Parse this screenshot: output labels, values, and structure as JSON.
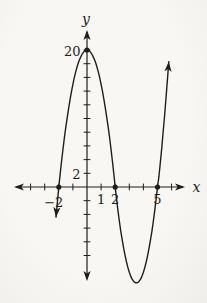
{
  "figure": {
    "background": "#f8f7f4",
    "ink": "#1f1e1c"
  },
  "chart_data": {
    "type": "line",
    "title": "",
    "xlabel": "x",
    "ylabel": "y",
    "grid": false,
    "legend": false,
    "x_range": [
      -5.2,
      6.9
    ],
    "y_range": [
      -13.8,
      22.9
    ],
    "x_ticks": [
      -4,
      -3,
      -2,
      -1,
      1,
      2,
      3,
      4,
      5,
      6
    ],
    "y_ticks": [
      -10,
      -8,
      -6,
      -4,
      -2,
      2,
      4,
      6,
      8,
      10,
      12,
      14,
      16,
      18,
      20
    ],
    "x_tick_labels": [
      {
        "value": -2,
        "label": "−2"
      },
      {
        "value": 1,
        "label": "1"
      },
      {
        "value": 2,
        "label": "2"
      },
      {
        "value": 5,
        "label": "5"
      }
    ],
    "y_tick_labels": [
      {
        "value": 2,
        "label": "2"
      },
      {
        "value": 20,
        "label": "20"
      }
    ],
    "x_intercepts": [
      -2,
      2,
      5
    ],
    "y_intercept": 20,
    "local_max_point": [
      0,
      20
    ],
    "local_min_point": [
      3.5,
      -14
    ],
    "marked_points": [
      [
        -2,
        0
      ],
      [
        0,
        20
      ],
      [
        2,
        0
      ],
      [
        5,
        0
      ]
    ],
    "open_ended_curve": true,
    "curve_points": [
      [
        -2.2,
        -4.4
      ],
      [
        -2.1,
        -2.2
      ],
      [
        -2,
        0
      ],
      [
        -1.9,
        1.95
      ],
      [
        -1.8,
        3.8
      ],
      [
        -1.7,
        5.55
      ],
      [
        -1.6,
        7.2
      ],
      [
        -1.5,
        8.75
      ],
      [
        -1.4,
        10.2
      ],
      [
        -1.3,
        11.55
      ],
      [
        -1.2,
        12.8
      ],
      [
        -1.1,
        13.95
      ],
      [
        -1,
        15
      ],
      [
        -0.9,
        15.95
      ],
      [
        -0.8,
        16.8
      ],
      [
        -0.7,
        17.55
      ],
      [
        -0.6,
        18.2
      ],
      [
        -0.5,
        18.75
      ],
      [
        -0.4,
        19.2
      ],
      [
        -0.3,
        19.55
      ],
      [
        -0.2,
        19.8
      ],
      [
        -0.1,
        19.95
      ],
      [
        0,
        20
      ],
      [
        0.1,
        19.95
      ],
      [
        0.2,
        19.8
      ],
      [
        0.3,
        19.55
      ],
      [
        0.4,
        19.2
      ],
      [
        0.5,
        18.75
      ],
      [
        0.6,
        18.2
      ],
      [
        0.7,
        17.55
      ],
      [
        0.8,
        16.8
      ],
      [
        0.9,
        15.95
      ],
      [
        1,
        15
      ],
      [
        1.1,
        13.95
      ],
      [
        1.2,
        12.8
      ],
      [
        1.3,
        11.55
      ],
      [
        1.4,
        10.2
      ],
      [
        1.5,
        8.75
      ],
      [
        1.6,
        7.2
      ],
      [
        1.7,
        5.55
      ],
      [
        1.8,
        3.8
      ],
      [
        1.9,
        1.95
      ],
      [
        2,
        0
      ],
      [
        2.1,
        -1.8
      ],
      [
        2.2,
        -3.48
      ],
      [
        2.3,
        -5.04
      ],
      [
        2.4,
        -6.47
      ],
      [
        2.5,
        -7.78
      ],
      [
        2.6,
        -8.96
      ],
      [
        2.7,
        -10.02
      ],
      [
        2.8,
        -10.95
      ],
      [
        2.9,
        -11.76
      ],
      [
        3,
        -12.44
      ],
      [
        3.1,
        -13
      ],
      [
        3.2,
        -13.44
      ],
      [
        3.3,
        -13.75
      ],
      [
        3.4,
        -13.94
      ],
      [
        3.5,
        -14
      ],
      [
        3.6,
        -13.94
      ],
      [
        3.7,
        -13.75
      ],
      [
        3.8,
        -13.44
      ],
      [
        3.9,
        -13
      ],
      [
        4,
        -12.44
      ],
      [
        4.1,
        -11.76
      ],
      [
        4.2,
        -10.95
      ],
      [
        4.3,
        -10.02
      ],
      [
        4.4,
        -8.96
      ],
      [
        4.5,
        -7.78
      ],
      [
        4.6,
        -6.47
      ],
      [
        4.7,
        -5.04
      ],
      [
        4.8,
        -3.48
      ],
      [
        4.9,
        -1.8
      ],
      [
        5,
        0
      ],
      [
        5.1,
        1.5
      ],
      [
        5.2,
        3.5
      ],
      [
        5.3,
        5.6
      ],
      [
        5.4,
        8
      ],
      [
        5.5,
        10.4
      ],
      [
        5.6,
        13
      ],
      [
        5.7,
        15.6
      ],
      [
        5.8,
        18.3
      ]
    ]
  }
}
